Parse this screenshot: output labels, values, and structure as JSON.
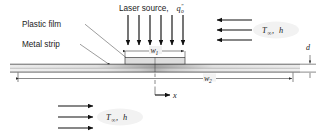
{
  "figure": {
    "type": "engineering-schematic"
  },
  "labels": {
    "laser_source": "Laser source,",
    "laser_symbol_base": "q",
    "laser_symbol_sub": "o",
    "laser_symbol_sup": "″",
    "plastic_film": "Plastic film",
    "metal_strip": "Metal strip",
    "x_axis": "x",
    "thickness": "d",
    "width_inner_base": "w",
    "width_inner_sub": "1",
    "width_outer_base": "w",
    "width_outer_sub": "2",
    "ambient_temp": "T",
    "ambient_sub": "∞",
    "convection_coeff": "h",
    "comma": ", "
  },
  "convection_top": {
    "label_temp": "T",
    "label_sub": "∞",
    "label_h": "h",
    "arrow_count": 3,
    "direction": "left"
  },
  "convection_bottom": {
    "label_temp": "T",
    "label_sub": "∞",
    "label_h": "h",
    "arrow_count": 3,
    "direction": "right"
  },
  "laser": {
    "arrow_count": 6,
    "direction": "down"
  },
  "colors": {
    "ink": "#1a1a1a",
    "line": "#2b2b2b",
    "leader": "#5a5a5a",
    "plate_light": "#e4e4e4",
    "plate_mid": "#c9c9c9",
    "plate_dark": "#9a9a9a",
    "strip_fill": "#dcdcdc",
    "halo": "#f2f2f2",
    "background": "#ffffff"
  },
  "geometry": {
    "plate_left": 10,
    "plate_right": 300,
    "plate_top": 64,
    "plate_bottom": 72,
    "strip_left": 125,
    "strip_right": 185,
    "strip_top": 57,
    "centerline_x": 155
  }
}
